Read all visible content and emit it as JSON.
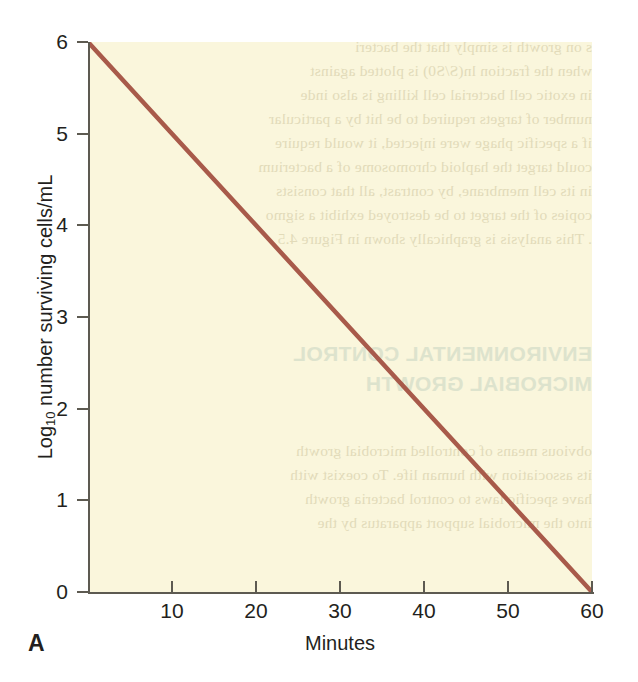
{
  "panel": {
    "label": "A"
  },
  "chart_data": {
    "type": "line",
    "title": "",
    "xlabel": "Minutes",
    "ylabel": "Log10 number surviving cells/mL",
    "ylabel_base": "Log",
    "ylabel_sub": "10",
    "ylabel_rest": " number surviving cells/mL",
    "xlim": [
      0,
      60
    ],
    "ylim": [
      0,
      6
    ],
    "grid": false,
    "legend": null,
    "xticks": [
      10,
      20,
      30,
      40,
      50,
      60
    ],
    "xtick_labels": [
      "10",
      "20",
      "30",
      "40",
      "50",
      "60"
    ],
    "yticks": [
      0,
      1,
      2,
      3,
      4,
      5,
      6
    ],
    "ytick_labels": [
      "0",
      "1",
      "2",
      "3",
      "4",
      "5",
      "6"
    ],
    "plot_bgcolor": "#faf6dc",
    "line_color": "#a85a4a",
    "axis_color": "#5d5a51",
    "series": [
      {
        "name": "surviving cells",
        "x": [
          0,
          10,
          20,
          30,
          40,
          50,
          60
        ],
        "values": [
          6,
          5,
          4,
          3,
          2,
          1,
          0
        ]
      }
    ]
  },
  "bleedthrough": {
    "note": "faint mirrored text showing through from reverse of printed page",
    "lines": [
      "s on growth is simply that the bacteri",
      "when the fraction ln(S/S0) is plotted against",
      "in exotic cell bacterial cell killing is also inde",
      "number of targets required to be hit by a particular",
      "if a specific phage were injected, it would require",
      "could target the haploid chromosome of a bacterium",
      "in its cell membrane, by contrast, all that consists",
      "copies of the target to be destroyed exhibit a sigmo",
      ". This analysis is graphically shown in Figure 4.5"
    ],
    "heading_lines": [
      "ENVIRONMENTAL CONTROL",
      "MICROBIAL GROWTH"
    ],
    "lower_lines": [
      "obvious means of controlled microbial growth",
      "its association with human life. To coexist with",
      "have specific laws to control bacteria growth",
      "into the microbial support apparatus by the"
    ]
  }
}
